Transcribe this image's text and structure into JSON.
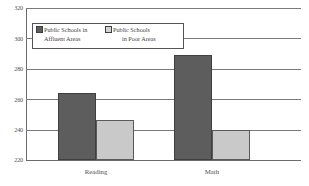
{
  "chart_data": {
    "type": "bar",
    "title": "",
    "xlabel": "",
    "ylabel": "",
    "categories": [
      "Reading",
      "Math"
    ],
    "series": [
      {
        "name": "Public Schools in Affluent Areas",
        "name_line1": "Public Schools in",
        "name_line2": "Affluent Areas",
        "color": "#5d5d5d",
        "values": [
          264,
          289
        ]
      },
      {
        "name": "Public Schools in Poor Areas",
        "name_line1": "Public Schools",
        "name_line2": "in Poor Areas",
        "color": "#c9c9c9",
        "values": [
          246,
          240
        ]
      }
    ],
    "ylim": [
      220,
      320
    ],
    "y_ticks": [
      220,
      240,
      260,
      280,
      300,
      320
    ],
    "y_tick_labels": [
      "220",
      "240",
      "260",
      "280",
      "300",
      "320"
    ],
    "grid": true,
    "legend_position": "upper-left"
  }
}
